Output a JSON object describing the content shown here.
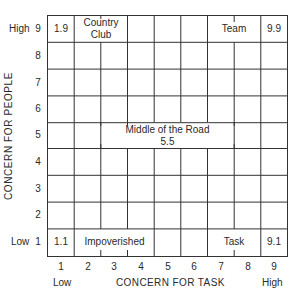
{
  "diagram": {
    "type": "managerial-grid",
    "x_axis": {
      "title": "CONCERN FOR TASK",
      "low_label": "Low",
      "high_label": "High",
      "ticks": [
        "1",
        "2",
        "3",
        "4",
        "5",
        "6",
        "7",
        "8",
        "9"
      ]
    },
    "y_axis": {
      "title": "CONCERN FOR PEOPLE",
      "low_label": "Low",
      "high_label": "High",
      "ticks": [
        "9",
        "8",
        "7",
        "6",
        "5",
        "4",
        "3",
        "2",
        "1"
      ]
    },
    "styles": [
      {
        "code": "1.9",
        "name_line1": "Country",
        "name_line2": "Club"
      },
      {
        "code": "9.9",
        "name": "Team"
      },
      {
        "name": "Middle of the Road",
        "code": "5.5"
      },
      {
        "code": "1.1",
        "name": "Impoverished"
      },
      {
        "code": "9.1",
        "name": "Task"
      }
    ]
  }
}
